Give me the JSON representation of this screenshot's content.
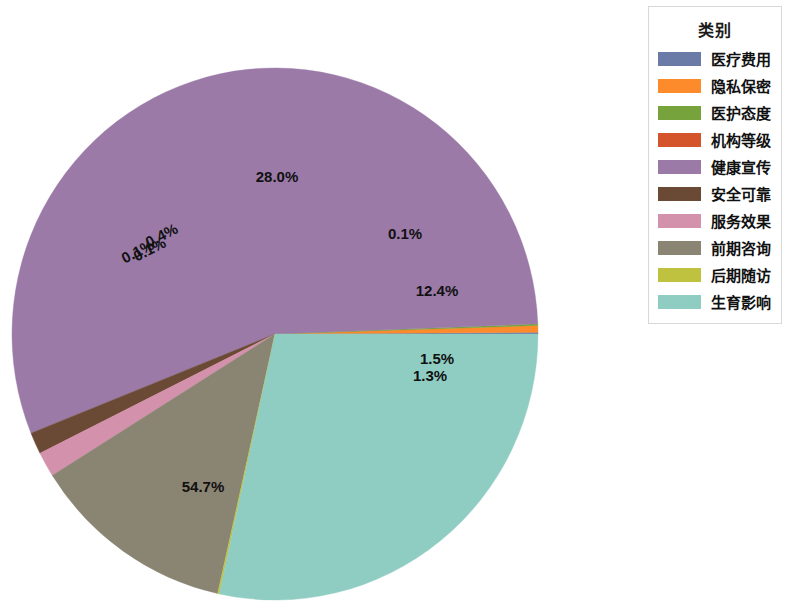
{
  "legend": {
    "title": "类别"
  },
  "chart_data": {
    "type": "pie",
    "title": "",
    "legend_title": "类别",
    "legend_position": "right",
    "label_format": "percent",
    "startangle": 0,
    "counterclock": true,
    "categories": [
      "医疗费用",
      "隐私保密",
      "医护态度",
      "机构等级",
      "健康宣传",
      "安全可靠",
      "服务效果",
      "前期咨询",
      "后期随访",
      "生育影响"
    ],
    "values": [
      0.1,
      0.4,
      0.1,
      0.0,
      54.7,
      1.3,
      1.5,
      12.4,
      0.1,
      28.0
    ],
    "labels": [
      "0.1%",
      "0.4%",
      "0.1%",
      "",
      "54.7%",
      "1.3%",
      "1.5%",
      "12.4%",
      "0.1%",
      "28.0%"
    ],
    "colors": [
      "#6b7ba8",
      "#fd8b2c",
      "#77a33c",
      "#d4552b",
      "#9b7aa8",
      "#6b4a35",
      "#d491ab",
      "#8a8473",
      "#bfc23e",
      "#8fcdc2"
    ],
    "slices": [
      {
        "name": "医疗费用",
        "value": 0.1,
        "label": "0.1%",
        "color": "#6b7ba8",
        "label_x": 152,
        "label_y": 254,
        "label_rotate": -27
      },
      {
        "name": "隐私保密",
        "value": 0.4,
        "label": "0.4%",
        "color": "#fd8b2c",
        "label_x": 164,
        "label_y": 240,
        "label_rotate": -27
      },
      {
        "name": "医护态度",
        "value": 0.1,
        "label": "0.1%",
        "color": "#77a33c",
        "label_x": 140,
        "label_y": 256,
        "label_rotate": -27
      },
      {
        "name": "机构等级",
        "value": 0.0,
        "label": "",
        "color": "#d4552b",
        "label_x": 0,
        "label_y": 0,
        "label_rotate": 0
      },
      {
        "name": "健康宣传",
        "value": 54.7,
        "label": "54.7%",
        "color": "#9b7aa8",
        "label_x": 203,
        "label_y": 492,
        "label_rotate": 0
      },
      {
        "name": "安全可靠",
        "value": 1.3,
        "label": "1.3%",
        "color": "#6b4a35",
        "label_x": 430,
        "label_y": 381,
        "label_rotate": 0
      },
      {
        "name": "服务效果",
        "value": 1.5,
        "label": "1.5%",
        "color": "#d491ab",
        "label_x": 437,
        "label_y": 364,
        "label_rotate": 0
      },
      {
        "name": "前期咨询",
        "value": 12.4,
        "label": "12.4%",
        "color": "#8a8473",
        "label_x": 437,
        "label_y": 296,
        "label_rotate": 0
      },
      {
        "name": "后期随访",
        "value": 0.1,
        "label": "0.1%",
        "color": "#bfc23e",
        "label_x": 405,
        "label_y": 239,
        "label_rotate": 0
      },
      {
        "name": "生育影响",
        "value": 28.0,
        "label": "28.0%",
        "color": "#8fcdc2",
        "label_x": 277,
        "label_y": 182,
        "label_rotate": 0
      }
    ],
    "geometry": {
      "cx": 275,
      "cy": 334,
      "rx": 263,
      "ry": 266
    }
  }
}
